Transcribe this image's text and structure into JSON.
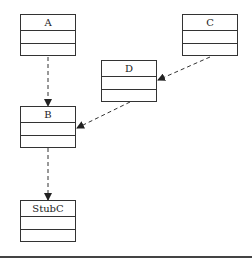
{
  "diagram": {
    "type": "uml-class-dependency",
    "classes": [
      {
        "id": "A",
        "name": "A"
      },
      {
        "id": "C",
        "name": "C"
      },
      {
        "id": "D",
        "name": "D"
      },
      {
        "id": "B",
        "name": "B"
      },
      {
        "id": "StubC",
        "name": "StubC"
      }
    ],
    "edges": [
      {
        "from": "A",
        "to": "B",
        "style": "dashed",
        "arrow": "filled"
      },
      {
        "from": "C",
        "to": "D",
        "style": "dashed",
        "arrow": "filled"
      },
      {
        "from": "D",
        "to": "B",
        "style": "dashed",
        "arrow": "filled"
      },
      {
        "from": "B",
        "to": "StubC",
        "style": "dashed",
        "arrow": "filled"
      }
    ],
    "colors": {
      "line": "#333333",
      "background": "#ffffff"
    }
  }
}
